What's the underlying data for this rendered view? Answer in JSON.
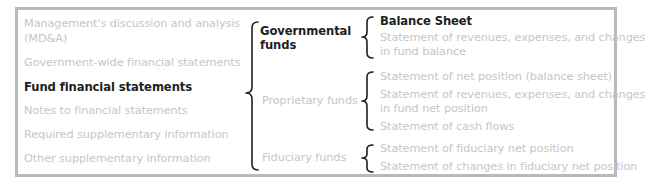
{
  "left_column": {
    "items": [
      {
        "label": "Management's discussion and analysis",
        "label2": "(MD&A)",
        "highlighted": false
      },
      {
        "label": "Government-wide financial statements",
        "highlighted": false
      },
      {
        "label": "Fund financial statements",
        "highlighted": true
      },
      {
        "label": "Notes to financial statements",
        "highlighted": false
      },
      {
        "label": "Required supplementary information",
        "highlighted": false
      },
      {
        "label": "Other supplementary information",
        "highlighted": false
      }
    ]
  },
  "middle_column": {
    "funds": [
      {
        "label": "Governmental",
        "label2": "funds",
        "highlighted": true
      },
      {
        "label": "Proprietary funds",
        "highlighted": false
      },
      {
        "label": "Fiduciary funds",
        "highlighted": false
      }
    ]
  },
  "right_column": {
    "governmental": [
      {
        "label": "Balance Sheet",
        "highlighted": true
      },
      {
        "label": "Statement of revenues, expenses, and changes",
        "label2": "in fund balance",
        "highlighted": false
      }
    ],
    "proprietary": [
      {
        "label": "Statement of net position (balance sheet)"
      },
      {
        "label": "Statement of revenues, expenses, and changes",
        "label2": "in fund net position"
      },
      {
        "label": "Statement of cash flows"
      }
    ],
    "fiduciary": [
      {
        "label": "Statement of fiduciary net position"
      },
      {
        "label": "Statement of changes in fiduciary net position"
      }
    ]
  },
  "colors": {
    "frame": "#b9b9b9",
    "muted_text": "#c6c6c6",
    "highlight_text": "#1e1e1e"
  }
}
